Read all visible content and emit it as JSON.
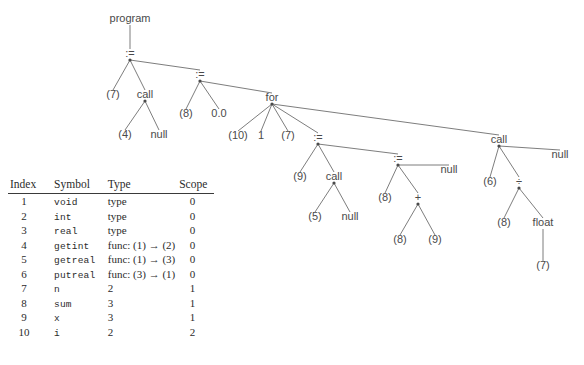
{
  "figure": {
    "tree": {
      "nodes": [
        {
          "id": "program",
          "label": "program",
          "x": 130,
          "y": 22,
          "dot": false
        },
        {
          "id": "assign1",
          "label": ":=",
          "x": 130,
          "y": 57,
          "dot": true
        },
        {
          "id": "n7a",
          "label": "(7)",
          "x": 113,
          "y": 98,
          "dot": false
        },
        {
          "id": "call1",
          "label": "call",
          "x": 145,
          "y": 98,
          "dot": true
        },
        {
          "id": "n4",
          "label": "(4)",
          "x": 125,
          "y": 138,
          "dot": false
        },
        {
          "id": "null1",
          "label": "null",
          "x": 159,
          "y": 138,
          "dot": false
        },
        {
          "id": "assign2",
          "label": ":=",
          "x": 200,
          "y": 78,
          "dot": true
        },
        {
          "id": "n8a",
          "label": "(8)",
          "x": 186,
          "y": 117,
          "dot": false
        },
        {
          "id": "zero",
          "label": "0.0",
          "x": 219,
          "y": 117,
          "dot": false
        },
        {
          "id": "for",
          "label": "for",
          "x": 272,
          "y": 101,
          "dot": true
        },
        {
          "id": "n10",
          "label": "(10)",
          "x": 238,
          "y": 139,
          "dot": false
        },
        {
          "id": "one",
          "label": "1",
          "x": 261,
          "y": 139,
          "dot": false
        },
        {
          "id": "n7b",
          "label": "(7)",
          "x": 288,
          "y": 139,
          "dot": false
        },
        {
          "id": "assign3",
          "label": ":=",
          "x": 318,
          "y": 141,
          "dot": true
        },
        {
          "id": "n9a",
          "label": "(9)",
          "x": 300,
          "y": 180,
          "dot": false
        },
        {
          "id": "call2",
          "label": "call",
          "x": 334,
          "y": 180,
          "dot": true
        },
        {
          "id": "n5",
          "label": "(5)",
          "x": 315,
          "y": 220,
          "dot": false
        },
        {
          "id": "null2",
          "label": "null",
          "x": 350,
          "y": 220,
          "dot": false
        },
        {
          "id": "assign4",
          "label": ":=",
          "x": 398,
          "y": 162,
          "dot": true
        },
        {
          "id": "null3",
          "label": "null",
          "x": 449,
          "y": 173,
          "dot": false
        },
        {
          "id": "n8b",
          "label": "(8)",
          "x": 385,
          "y": 201,
          "dot": false
        },
        {
          "id": "plus",
          "label": "+",
          "x": 418,
          "y": 201,
          "dot": true
        },
        {
          "id": "n8c",
          "label": "(8)",
          "x": 400,
          "y": 243,
          "dot": false
        },
        {
          "id": "n9b",
          "label": "(9)",
          "x": 435,
          "y": 243,
          "dot": false
        },
        {
          "id": "call3",
          "label": "call",
          "x": 499,
          "y": 143,
          "dot": true
        },
        {
          "id": "null4",
          "label": "null",
          "x": 560,
          "y": 158,
          "dot": false
        },
        {
          "id": "n6",
          "label": "(6)",
          "x": 490,
          "y": 185,
          "dot": false
        },
        {
          "id": "div",
          "label": "÷",
          "x": 519,
          "y": 185,
          "dot": true
        },
        {
          "id": "n8d",
          "label": "(8)",
          "x": 504,
          "y": 226,
          "dot": false
        },
        {
          "id": "float",
          "label": "float",
          "x": 543,
          "y": 226,
          "dot": false
        },
        {
          "id": "n7c",
          "label": "(7)",
          "x": 543,
          "y": 269,
          "dot": false
        }
      ],
      "edges": [
        [
          "program",
          "assign1"
        ],
        [
          "assign1",
          "n7a"
        ],
        [
          "assign1",
          "call1"
        ],
        [
          "assign1",
          "assign2"
        ],
        [
          "call1",
          "n4"
        ],
        [
          "call1",
          "null1"
        ],
        [
          "assign2",
          "n8a"
        ],
        [
          "assign2",
          "zero"
        ],
        [
          "assign2",
          "for"
        ],
        [
          "for",
          "n10"
        ],
        [
          "for",
          "one"
        ],
        [
          "for",
          "n7b"
        ],
        [
          "for",
          "assign3"
        ],
        [
          "for",
          "call3"
        ],
        [
          "assign3",
          "n9a"
        ],
        [
          "assign3",
          "call2"
        ],
        [
          "assign3",
          "assign4"
        ],
        [
          "call2",
          "n5"
        ],
        [
          "call2",
          "null2"
        ],
        [
          "assign4",
          "n8b"
        ],
        [
          "assign4",
          "plus"
        ],
        [
          "assign4",
          "null3"
        ],
        [
          "plus",
          "n8c"
        ],
        [
          "plus",
          "n9b"
        ],
        [
          "call3",
          "n6"
        ],
        [
          "call3",
          "div"
        ],
        [
          "call3",
          "null4"
        ],
        [
          "div",
          "n8d"
        ],
        [
          "div",
          "float"
        ],
        [
          "float",
          "n7c"
        ]
      ]
    },
    "symbol_table": {
      "headers": [
        "Index",
        "Symbol",
        "Type",
        "Scope"
      ],
      "rows": [
        {
          "index": "1",
          "symbol": "void",
          "type": "type",
          "scope": "0"
        },
        {
          "index": "2",
          "symbol": "int",
          "type": "type",
          "scope": "0"
        },
        {
          "index": "3",
          "symbol": "real",
          "type": "type",
          "scope": "0"
        },
        {
          "index": "4",
          "symbol": "getint",
          "type": "func: (1) → (2)",
          "scope": "0"
        },
        {
          "index": "5",
          "symbol": "getreal",
          "type": "func: (1) → (3)",
          "scope": "0"
        },
        {
          "index": "6",
          "symbol": "putreal",
          "type": "func: (3) → (1)",
          "scope": "0"
        },
        {
          "index": "7",
          "symbol": "n",
          "type": "2",
          "scope": "1"
        },
        {
          "index": "8",
          "symbol": "sum",
          "type": "3",
          "scope": "1"
        },
        {
          "index": "9",
          "symbol": "x",
          "type": "3",
          "scope": "1"
        },
        {
          "index": "10",
          "symbol": "i",
          "type": "2",
          "scope": "2"
        }
      ]
    },
    "colors": {
      "background": "#ffffff",
      "edge": "#6e6e6e",
      "node_text": "#4a4a4a",
      "table_text": "#2b2b2b",
      "rule": "#3a3a3a"
    }
  }
}
